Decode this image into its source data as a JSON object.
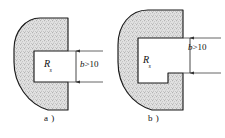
{
  "figure": {
    "background_color": "#ffffff",
    "outline_color": "#1a1a1a",
    "hatch_fill_color": "#d9d9d9",
    "dimension_line_color": "#444444",
    "panels": [
      {
        "id": "a",
        "caption": "a )",
        "radius_label_main": "R",
        "radius_label_sub": "s",
        "dimension_label_symbol": "b",
        "dimension_label_rest": ">10",
        "dimension_label_full": "b >10",
        "notch_type": "rectangular-slot"
      },
      {
        "id": "b",
        "caption": "b )",
        "radius_label_main": "R",
        "radius_label_sub": "s",
        "dimension_label_symbol": "b",
        "dimension_label_rest": ">10",
        "dimension_label_full": "b >10",
        "notch_type": "stepped-slot"
      }
    ]
  }
}
